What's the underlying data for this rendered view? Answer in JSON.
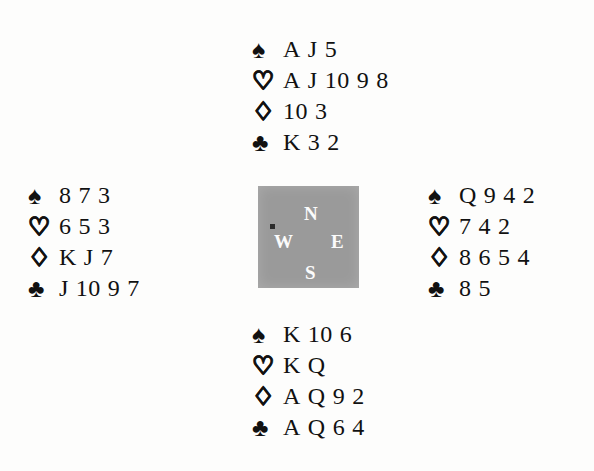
{
  "diagram": {
    "type": "bridge-deal-diagram",
    "background_color": "#fdfdfc",
    "ink_color": "#111111"
  },
  "suits": {
    "spade": {
      "name": "spade-suit-symbol",
      "glyph": "♠",
      "style": "filled"
    },
    "heart": {
      "name": "heart-suit-symbol",
      "glyph": "♡",
      "style": "outline"
    },
    "diamond": {
      "name": "diamond-suit-symbol",
      "glyph": "♢",
      "style": "outline"
    },
    "club": {
      "name": "club-suit-symbol",
      "glyph": "♣",
      "style": "filled"
    }
  },
  "compass": {
    "box_color": "#9a9a9a",
    "label_color": "#fbfbfb",
    "north": "N",
    "west": "W",
    "east": "E",
    "south": "S"
  },
  "hands": {
    "north": {
      "position": "North",
      "spades": [
        "A",
        "J",
        "5"
      ],
      "hearts": [
        "A",
        "J",
        "10",
        "9",
        "8"
      ],
      "diamonds": [
        "10",
        "3"
      ],
      "clubs": [
        "K",
        "3",
        "2"
      ]
    },
    "west": {
      "position": "West",
      "spades": [
        "8",
        "7",
        "3"
      ],
      "hearts": [
        "6",
        "5",
        "3"
      ],
      "diamonds": [
        "K",
        "J",
        "7"
      ],
      "clubs": [
        "J",
        "10",
        "9",
        "7"
      ]
    },
    "east": {
      "position": "East",
      "spades": [
        "Q",
        "9",
        "4",
        "2"
      ],
      "hearts": [
        "7",
        "4",
        "2"
      ],
      "diamonds": [
        "8",
        "6",
        "5",
        "4"
      ],
      "clubs": [
        "8",
        "5"
      ]
    },
    "south": {
      "position": "South",
      "spades": [
        "K",
        "10",
        "6"
      ],
      "hearts": [
        "K",
        "Q"
      ],
      "diamonds": [
        "A",
        "Q",
        "9",
        "2"
      ],
      "clubs": [
        "A",
        "Q",
        "6",
        "4"
      ]
    }
  }
}
